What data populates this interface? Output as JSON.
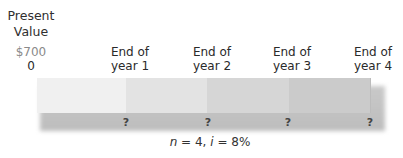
{
  "present_value": {
    "title_line1": "Present",
    "title_line2": "Value",
    "amount": "$700",
    "period": "0"
  },
  "periods": [
    {
      "line1": "End of",
      "line2": "year 1",
      "cash_flow": "?"
    },
    {
      "line1": "End of",
      "line2": "year 2",
      "cash_flow": "?"
    },
    {
      "line1": "End of",
      "line2": "year 3",
      "cash_flow": "?"
    },
    {
      "line1": "End of",
      "line2": "year 4",
      "cash_flow": "?"
    }
  ],
  "caption": {
    "n_var": "n",
    "n_text": " = 4, ",
    "i_var": "i",
    "i_text": " = 8%"
  },
  "colors": {
    "segment_0": "#f0f0f0",
    "segment_1": "#e3e3e3",
    "segment_2": "#d6d6d6",
    "segment_3": "#cbcbcb",
    "shadow": "#c2c2c2",
    "amount_text": "#8a8a8a"
  }
}
